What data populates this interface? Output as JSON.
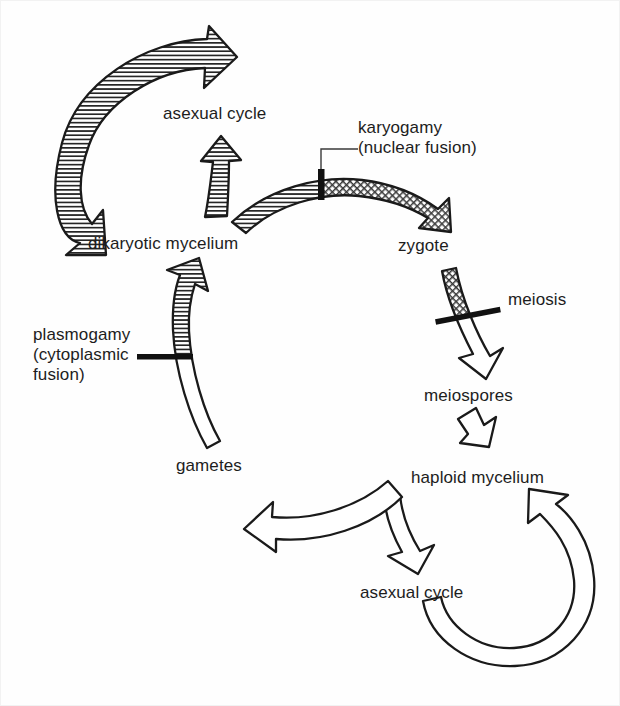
{
  "diagram": {
    "background_color": "#fefefe",
    "ink_color": "#1a1a1a",
    "labels": {
      "asexual_cycle_top": "asexual cycle",
      "dikaryotic_mycelium": "dikaryotic mycelium",
      "karyogamy_line1": "karyogamy",
      "karyogamy_line2": "(nuclear fusion)",
      "zygote": "zygote",
      "meiosis": "meiosis",
      "meiospores": "meiospores",
      "haploid_mycelium": "haploid mycelium",
      "asexual_cycle_bottom": "asexual cycle",
      "gametes": "gametes",
      "plasmogamy_line1": "plasmogamy",
      "plasmogamy_line2": "(cytoplasmic",
      "plasmogamy_line3": "fusion)"
    },
    "nodes": [
      {
        "id": "asexual-cycle-top",
        "label": "asexual cycle",
        "x": 163,
        "y": 104
      },
      {
        "id": "dikaryotic-mycelium",
        "label": "dikaryotic mycelium",
        "x": 88,
        "y": 234
      },
      {
        "id": "zygote",
        "label": "zygote",
        "x": 398,
        "y": 236
      },
      {
        "id": "meiospores",
        "label": "meiospores",
        "x": 424,
        "y": 386
      },
      {
        "id": "haploid-mycelium",
        "label": "haploid mycelium",
        "x": 411,
        "y": 468
      },
      {
        "id": "asexual-cycle-bottom",
        "label": "asexual cycle",
        "x": 360,
        "y": 583
      },
      {
        "id": "gametes",
        "label": "gametes",
        "x": 176,
        "y": 456
      }
    ],
    "annotations": [
      {
        "id": "karyogamy",
        "text": "karyogamy (nuclear fusion)",
        "x": 358,
        "y": 118,
        "has_leader_line": true
      },
      {
        "id": "meiosis",
        "text": "meiosis",
        "x": 508,
        "y": 290,
        "has_leader_line": false
      },
      {
        "id": "plasmogamy",
        "text": "plasmogamy (cytoplasmic fusion)",
        "x": 33,
        "y": 325,
        "has_leader_line": false
      }
    ],
    "transitions": [
      {
        "id": "karyogamy-bar",
        "name": "karyogamy",
        "type": "event-bar",
        "from": "dikaryotic mycelium",
        "to": "zygote"
      },
      {
        "id": "meiosis-bar",
        "name": "meiosis",
        "type": "event-bar",
        "from": "zygote",
        "to": "meiospores"
      },
      {
        "id": "plasmogamy-bar",
        "name": "plasmogamy",
        "type": "event-bar",
        "from": "gametes",
        "to": "dikaryotic mycelium"
      }
    ],
    "arrows": [
      {
        "id": "dikaryotic-asexual-loop",
        "fill": "horizontal-hatch",
        "from": "asexual cycle",
        "to": "dikaryotic mycelium"
      },
      {
        "id": "dikaryotic-to-asexual",
        "fill": "horizontal-hatch",
        "from": "dikaryotic mycelium",
        "to": "asexual cycle"
      },
      {
        "id": "dikaryotic-to-zygote",
        "fill": "horizontal-hatch-then-crosshatch",
        "from": "dikaryotic mycelium",
        "to": "zygote"
      },
      {
        "id": "zygote-to-meiospores",
        "fill": "crosshatch-then-white",
        "from": "zygote",
        "to": "meiospores"
      },
      {
        "id": "meiospores-to-haploid",
        "fill": "white",
        "from": "meiospores",
        "to": "haploid mycelium"
      },
      {
        "id": "haploid-to-asexual",
        "fill": "white",
        "from": "haploid mycelium",
        "to": "asexual cycle"
      },
      {
        "id": "asexual-to-haploid-loop",
        "fill": "white",
        "from": "asexual cycle",
        "to": "haploid mycelium"
      },
      {
        "id": "haploid-to-gametes",
        "fill": "white",
        "from": "haploid mycelium",
        "to": "gametes"
      },
      {
        "id": "gametes-to-dikaryotic",
        "fill": "white-then-horizontal-hatch",
        "from": "gametes",
        "to": "dikaryotic mycelium"
      }
    ]
  }
}
